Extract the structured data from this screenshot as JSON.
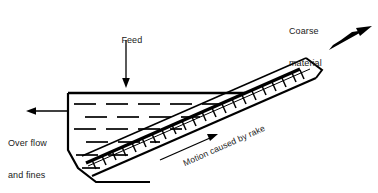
{
  "figure": {
    "type": "rake-classifier-diagram",
    "background_color": "#ffffff",
    "line_color": "#000000",
    "text_color": "#1a1a1a"
  },
  "labels": {
    "feed": "Feed",
    "coarse_material_line1": "Coarse",
    "coarse_material_line2": "material",
    "overflow_line1": "Over flow",
    "overflow_line2": "and fines",
    "motion": "Motion caused by rake"
  },
  "arrows": {
    "feed_direction": "down",
    "coarse_direction": "up-right",
    "overflow_direction": "left",
    "motion_direction": "up-right"
  },
  "components": {
    "tank": "settling tank with liquid level dashes",
    "inclined_trough": "inclined double-walled trough",
    "rake": "toothed rake bar",
    "rake_teeth_count": 22,
    "liquid_dash_rows": 5
  }
}
